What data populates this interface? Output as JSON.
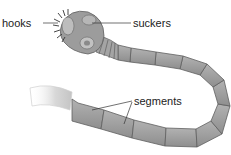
{
  "diagram": {
    "labels": {
      "hooks": "hooks",
      "suckers": "suckers",
      "segments": "segments"
    },
    "colors": {
      "body": "#9a9a9a",
      "body_light": "#b8b8b8",
      "outline": "#5f5f5f",
      "tail_fade": "#e6e6e6",
      "text": "#222222",
      "leader_line": "#333333"
    }
  }
}
